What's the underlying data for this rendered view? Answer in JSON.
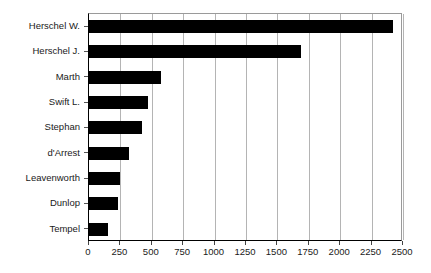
{
  "chart_data": {
    "type": "bar",
    "orientation": "horizontal",
    "title": "",
    "subtitle": "",
    "xlabel": "",
    "ylabel": "",
    "xlim": [
      0,
      2500
    ],
    "xticks": [
      0,
      250,
      500,
      750,
      1000,
      1250,
      1500,
      1750,
      2000,
      2250,
      2500
    ],
    "xtick_labels": [
      "0",
      "250",
      "500",
      "750",
      "1000",
      "1250",
      "1500",
      "1750",
      "2000",
      "2250",
      "2500"
    ],
    "grid": "vertical",
    "legend": null,
    "bar_color": "#000000",
    "categories": [
      "Herschel W.",
      "Herschel J.",
      "Marth",
      "Swift L.",
      "Stephan",
      "d'Arrest",
      "Leavenworth",
      "Dunlop",
      "Tempel"
    ],
    "values": [
      2420,
      1690,
      575,
      470,
      420,
      315,
      250,
      230,
      150
    ],
    "series": [
      {
        "name": "",
        "values": [
          2420,
          1690,
          575,
          470,
          420,
          315,
          250,
          230,
          150
        ]
      }
    ]
  },
  "axis": {
    "line_color": "#000000",
    "grid_color": "#b4b4b4",
    "text_color": "#1a1a1a"
  }
}
